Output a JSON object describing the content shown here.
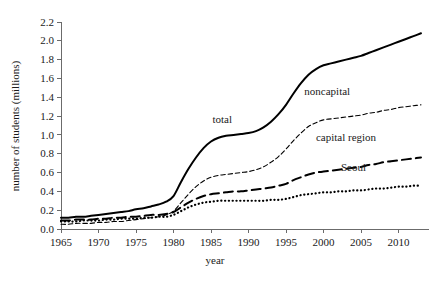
{
  "chart_data": {
    "type": "line",
    "title": "",
    "xlabel": "year",
    "ylabel": "number of students (millions)",
    "xlim": [
      1965,
      2013
    ],
    "ylim": [
      0.0,
      2.2
    ],
    "grid": false,
    "legend_position": "inline-annotations",
    "xticks": [
      1965,
      1970,
      1975,
      1980,
      1985,
      1990,
      1995,
      2000,
      2005,
      2010
    ],
    "xtick_labels": [
      "1965",
      "1970",
      "1975",
      "1980",
      "1985",
      "1990",
      "1995",
      "2000",
      "2005",
      "2010"
    ],
    "yticks": [
      0.0,
      0.2,
      0.4,
      0.6,
      0.8,
      1.0,
      1.2,
      1.4,
      1.6,
      1.8,
      2.0,
      2.2
    ],
    "ytick_labels": [
      "0.0",
      "0.2",
      "0.4",
      "0.6",
      "0.8",
      "1.0",
      "1.2",
      "1.4",
      "1.6",
      "1.8",
      "2.0",
      "2.2"
    ],
    "x": [
      1965,
      1966,
      1967,
      1968,
      1969,
      1970,
      1971,
      1972,
      1973,
      1974,
      1975,
      1976,
      1977,
      1978,
      1979,
      1980,
      1981,
      1982,
      1983,
      1984,
      1985,
      1986,
      1987,
      1988,
      1989,
      1990,
      1991,
      1992,
      1993,
      1994,
      1995,
      1996,
      1997,
      1998,
      1999,
      2000,
      2001,
      2002,
      2003,
      2004,
      2005,
      2006,
      2007,
      2008,
      2009,
      2010,
      2011,
      2012,
      2013
    ],
    "series": [
      {
        "name": "total",
        "style": "solid",
        "label": "total",
        "label_x": 1986.5,
        "label_y": 1.13,
        "values": [
          0.12,
          0.12,
          0.13,
          0.13,
          0.14,
          0.15,
          0.16,
          0.17,
          0.18,
          0.19,
          0.21,
          0.22,
          0.24,
          0.26,
          0.29,
          0.35,
          0.5,
          0.64,
          0.76,
          0.86,
          0.93,
          0.97,
          0.99,
          1.0,
          1.01,
          1.02,
          1.04,
          1.08,
          1.14,
          1.22,
          1.32,
          1.44,
          1.55,
          1.64,
          1.7,
          1.74,
          1.76,
          1.78,
          1.8,
          1.82,
          1.84,
          1.87,
          1.9,
          1.93,
          1.96,
          1.99,
          2.02,
          2.05,
          2.08
        ]
      },
      {
        "name": "noncapital",
        "style": "dashed-fine",
        "label": "noncapital",
        "label_x": 2000.5,
        "label_y": 1.42,
        "values": [
          0.05,
          0.05,
          0.06,
          0.06,
          0.06,
          0.07,
          0.07,
          0.08,
          0.08,
          0.09,
          0.1,
          0.11,
          0.12,
          0.13,
          0.15,
          0.19,
          0.28,
          0.37,
          0.45,
          0.51,
          0.55,
          0.57,
          0.58,
          0.59,
          0.6,
          0.61,
          0.63,
          0.66,
          0.71,
          0.77,
          0.85,
          0.94,
          1.02,
          1.09,
          1.13,
          1.16,
          1.17,
          1.18,
          1.19,
          1.2,
          1.21,
          1.23,
          1.24,
          1.26,
          1.27,
          1.29,
          1.3,
          1.31,
          1.32
        ]
      },
      {
        "name": "capital region",
        "style": "dashed-long",
        "label": "capital region",
        "label_x": 2003.0,
        "label_y": 0.93,
        "values": [
          0.09,
          0.09,
          0.1,
          0.1,
          0.1,
          0.11,
          0.11,
          0.12,
          0.12,
          0.13,
          0.13,
          0.14,
          0.15,
          0.15,
          0.16,
          0.18,
          0.23,
          0.28,
          0.32,
          0.35,
          0.37,
          0.38,
          0.39,
          0.4,
          0.4,
          0.41,
          0.42,
          0.43,
          0.44,
          0.46,
          0.48,
          0.52,
          0.55,
          0.58,
          0.6,
          0.61,
          0.62,
          0.63,
          0.64,
          0.65,
          0.66,
          0.68,
          0.69,
          0.71,
          0.72,
          0.73,
          0.74,
          0.75,
          0.76
        ]
      },
      {
        "name": "Seoul",
        "style": "dotted",
        "label": "Seoul",
        "label_x": 2004.0,
        "label_y": 0.62,
        "values": [
          0.08,
          0.08,
          0.08,
          0.09,
          0.09,
          0.09,
          0.1,
          0.1,
          0.11,
          0.11,
          0.11,
          0.12,
          0.12,
          0.13,
          0.13,
          0.15,
          0.19,
          0.23,
          0.26,
          0.28,
          0.29,
          0.3,
          0.3,
          0.3,
          0.3,
          0.3,
          0.3,
          0.3,
          0.31,
          0.31,
          0.32,
          0.34,
          0.36,
          0.37,
          0.38,
          0.39,
          0.39,
          0.4,
          0.4,
          0.41,
          0.41,
          0.42,
          0.43,
          0.43,
          0.44,
          0.45,
          0.45,
          0.46,
          0.46
        ]
      }
    ]
  },
  "colors": {
    "line": "#000000",
    "axis": "#6b6b6b",
    "text": "#1a1a1a",
    "background": "#ffffff"
  }
}
